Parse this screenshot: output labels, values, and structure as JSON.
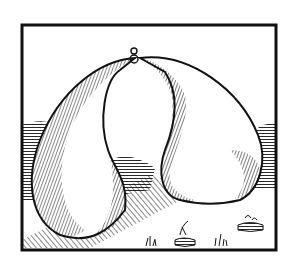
{
  "image": {
    "description": "Woodcut illustration of two large pear-shaped sacks joined at the top by a small ring, in a hilly landscape with tufts of grass, inside a black frame",
    "colors": {
      "ink": "#111111",
      "paper": "#ffffff"
    }
  }
}
